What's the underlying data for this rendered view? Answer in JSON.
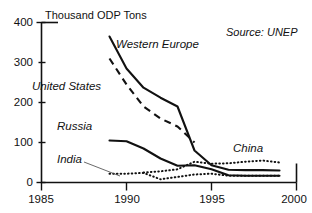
{
  "chart_data": {
    "type": "line",
    "title": "Thousand  ODP Tons",
    "xlabel": "",
    "ylabel": "",
    "xlim": [
      1985,
      2000
    ],
    "ylim": [
      0,
      400
    ],
    "xticks": [
      "1985",
      "1990",
      "1995",
      "2000"
    ],
    "yticks": [
      "0",
      "100",
      "200",
      "300",
      "400"
    ],
    "grid": false,
    "legend_position": "inline-labels",
    "annotations": [
      {
        "name": "source",
        "text": "Source: UNEP"
      }
    ],
    "series": [
      {
        "name": "Western Europe",
        "label": "Western Europe",
        "style": "solid",
        "x": [
          1989,
          1990,
          1991,
          1992,
          1993,
          1994,
          1995,
          1996,
          1997,
          1998,
          1999
        ],
        "values": [
          365,
          285,
          237,
          212,
          190,
          80,
          43,
          32,
          31,
          31,
          30
        ]
      },
      {
        "name": "United States",
        "label": "United States",
        "style": "dashed",
        "x": [
          1989,
          1990,
          1991,
          1992,
          1993,
          1994
        ],
        "values": [
          310,
          245,
          190,
          160,
          140,
          100
        ]
      },
      {
        "name": "Russia",
        "label": "Russia",
        "style": "solid",
        "x": [
          1989,
          1990,
          1991,
          1992,
          1993,
          1994,
          1995,
          1996,
          1997,
          1998,
          1999
        ],
        "values": [
          105,
          103,
          85,
          60,
          42,
          43,
          33,
          18,
          17,
          17,
          17
        ]
      },
      {
        "name": "India",
        "label": "India",
        "style": "dotted",
        "x": [
          1989,
          1990,
          1991,
          1992,
          1993,
          1994,
          1995,
          1996,
          1997,
          1998,
          1999
        ],
        "values": [
          22,
          22,
          24,
          8,
          14,
          20,
          22,
          17,
          17,
          17,
          17
        ]
      },
      {
        "name": "China",
        "label": "China",
        "style": "dotted",
        "x": [
          1991,
          1992,
          1993,
          1994,
          1995,
          1996,
          1997,
          1998,
          1999
        ],
        "values": [
          25,
          28,
          33,
          52,
          47,
          48,
          52,
          55,
          50
        ]
      }
    ]
  },
  "axis": {
    "title": "Thousand  ODP Tons",
    "y_ticks": [
      {
        "value": 400,
        "label": "400"
      },
      {
        "value": 300,
        "label": "300"
      },
      {
        "value": 200,
        "label": "200"
      },
      {
        "value": 100,
        "label": "100"
      },
      {
        "value": 0,
        "label": "0"
      }
    ],
    "x_ticks": [
      {
        "value": 1985,
        "label": "1985"
      },
      {
        "value": 1990,
        "label": "1990"
      },
      {
        "value": 1995,
        "label": "1995"
      },
      {
        "value": 2000,
        "label": "2000"
      }
    ]
  },
  "labels": {
    "western_europe": "Western Europe",
    "united_states": "United States",
    "russia": "Russia",
    "india": "India",
    "china": "China",
    "source": "Source: UNEP"
  },
  "colors": {
    "ink": "#111111",
    "background": "#ffffff",
    "leader": "#444444"
  }
}
